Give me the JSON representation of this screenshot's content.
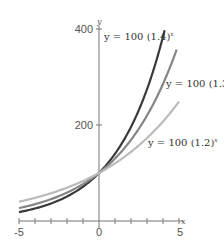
{
  "chart_data": {
    "type": "line",
    "title": "",
    "xlabel": "x",
    "ylabel": "y",
    "xlim": [
      -5,
      5
    ],
    "ylim": [
      0,
      400
    ],
    "x_ticks": [
      -5,
      -4,
      -3,
      -2,
      -1,
      0,
      1,
      2,
      3,
      4,
      5
    ],
    "x_tick_labels": [
      "-5",
      "0",
      "5"
    ],
    "y_ticks": [
      200,
      400
    ],
    "y_tick_labels": [
      "200",
      "400"
    ],
    "grid": false,
    "legend": "inline labels near curve ends",
    "series": [
      {
        "name": "y = 100 (1.4)^x",
        "base": 1.4,
        "coefficient": 100,
        "color": "#3a3a3a",
        "x_range": [
          -5,
          4.1
        ],
        "label_text": "y = 100 (1.4)",
        "label_exp": "x"
      },
      {
        "name": "y = 100 (1.3)^x",
        "base": 1.3,
        "coefficient": 100,
        "color": "#858585",
        "x_range": [
          -5,
          4.85
        ],
        "label_text": "y = 100 (1.3)",
        "label_exp": "x"
      },
      {
        "name": "y = 100 (1.2)^x",
        "base": 1.2,
        "coefficient": 100,
        "color": "#bbbbbb",
        "x_range": [
          -5,
          5
        ],
        "label_text": "y = 100 (1.2)",
        "label_exp": "x"
      }
    ],
    "axis_color": "#777777"
  },
  "labels": {
    "x_min": "-5",
    "x_zero": "0",
    "x_max": "5",
    "y_200": "200",
    "y_400": "400",
    "x_axis_name": "x",
    "y_axis_name": "y",
    "curve_14": "y = 100 (1.4)",
    "curve_13": "y = 100 (1.3)",
    "curve_12": "y = 100 (1.2)",
    "exp": "x"
  }
}
